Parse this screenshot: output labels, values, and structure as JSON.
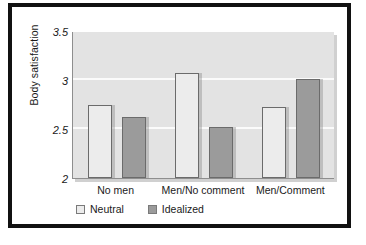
{
  "chart_data": {
    "type": "bar",
    "title": "",
    "xlabel": "",
    "ylabel": "Body satisfaction",
    "ylim": [
      2,
      3.5
    ],
    "yticks": [
      "2",
      "2.5",
      "3",
      "3.5"
    ],
    "ytick_values": [
      2,
      2.5,
      3,
      3.5
    ],
    "gridlines": [
      2.5,
      3
    ],
    "grid": true,
    "legend_position": "bottom-left",
    "categories": [
      "No men",
      "Men/No comment",
      "Men/Comment"
    ],
    "series": [
      {
        "name": "Neutral",
        "color": "#ececec",
        "values": [
          2.74,
          3.07,
          2.72
        ]
      },
      {
        "name": "Idealized",
        "color": "#9b9b9b",
        "values": [
          2.62,
          2.52,
          3.01
        ]
      }
    ]
  },
  "figure": {
    "plot_background": "#e3e3e3",
    "frame_color": "#111111",
    "page_background": "#ffffff"
  }
}
